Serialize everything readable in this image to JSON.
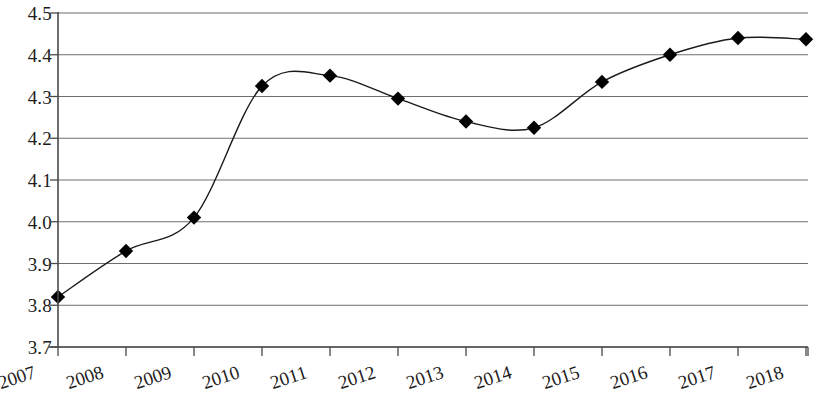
{
  "chart_data": {
    "type": "line",
    "title": "",
    "subtitle": "",
    "xlabel": "",
    "ylabel": "",
    "categories": [
      "2007",
      "2008",
      "2009",
      "2010",
      "2011",
      "2012",
      "2013",
      "2014",
      "2015",
      "2016",
      "2017",
      "2018"
    ],
    "values": [
      3.82,
      3.93,
      4.01,
      4.325,
      4.35,
      4.295,
      4.24,
      4.225,
      4.335,
      4.4,
      4.44,
      4.437
    ],
    "series": [
      {
        "name": "",
        "values": [
          3.82,
          3.93,
          4.01,
          4.325,
          4.35,
          4.295,
          4.24,
          4.225,
          4.335,
          4.4,
          4.44,
          4.437
        ]
      }
    ],
    "ylim": [
      3.7,
      4.5
    ],
    "ytick_step": 0.1,
    "yticks": [
      "4.5",
      "4.4",
      "4.3",
      "4.2",
      "4.1",
      "4.0",
      "3.9",
      "3.8",
      "3.7"
    ],
    "ytick_values": [
      4.5,
      4.4,
      4.3,
      4.2,
      4.1,
      4.0,
      3.9,
      3.8,
      3.7
    ],
    "grid": true,
    "grid_axis": "y",
    "legend": false,
    "legend_position": "none",
    "marker": "diamond",
    "line_color": "#1a1a1a",
    "marker_color": "#000000",
    "grid_color": "#6f6f6f",
    "axis_color": "#4a4a4a",
    "background": "#ffffff",
    "xlabel_rotation": -18,
    "smoothing": true,
    "annotations": []
  },
  "geometry": {
    "plot_left": 58,
    "plot_top": 13,
    "plot_width": 750,
    "plot_height": 334
  }
}
